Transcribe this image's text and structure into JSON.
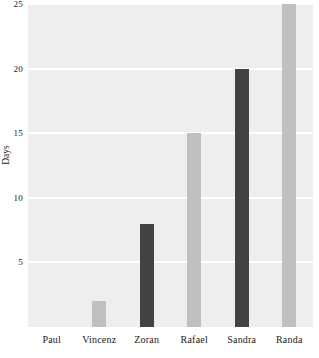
{
  "chart_data": {
    "type": "bar",
    "title": "",
    "xlabel": "",
    "ylabel": "Days",
    "categories": [
      "Paul",
      "Vincenz",
      "Zoran",
      "Rafael",
      "Sandra",
      "Randa"
    ],
    "values": [
      0,
      2,
      8,
      15,
      20,
      25
    ],
    "bar_colors": [
      "#c0c0c0",
      "#c0c0c0",
      "#424242",
      "#c0c0c0",
      "#424242",
      "#c0c0c0"
    ],
    "ylim": [
      0,
      25
    ],
    "yticks": [
      5,
      10,
      15,
      20,
      25
    ],
    "ytick_labels": [
      "5",
      "10",
      "15",
      "20",
      "25"
    ],
    "grid": true,
    "grid_color": "#ffffff",
    "plot_background": "#eeeeee",
    "page_background": "#ffffff",
    "legend": "none"
  },
  "axis": {
    "y_title": "Days"
  }
}
